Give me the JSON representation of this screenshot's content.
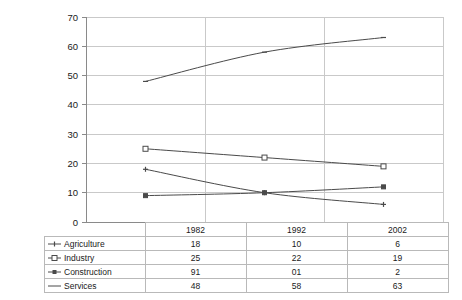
{
  "chart_data": {
    "type": "line",
    "title": "",
    "subtitle": "",
    "xlabel": "",
    "ylabel": "",
    "categories": [
      "1982",
      "1992",
      "2002"
    ],
    "ylim": [
      0,
      70
    ],
    "yticks": [
      0,
      10,
      20,
      30,
      40,
      50,
      60,
      70
    ],
    "grid": true,
    "legend_position": "table-below",
    "series": [
      {
        "name": "Agriculture",
        "values": [
          18,
          10,
          6
        ],
        "marker": "cross",
        "labels": [
          "18",
          "10",
          "6"
        ]
      },
      {
        "name": "Industry",
        "values": [
          25,
          22,
          19
        ],
        "marker": "square-open",
        "labels": [
          "25",
          "22",
          "19"
        ]
      },
      {
        "name": "Construction",
        "values": [
          9,
          10,
          12
        ],
        "marker": "square-filled",
        "labels": [
          "91",
          "01",
          "2"
        ]
      },
      {
        "name": "Services",
        "values": [
          48,
          58,
          63
        ],
        "marker": "dash",
        "labels": [
          "48",
          "58",
          "63"
        ]
      }
    ]
  },
  "axis": {
    "y_tick_labels": [
      "70",
      "60",
      "50",
      "40",
      "30",
      "20",
      "10",
      "0"
    ]
  },
  "table": {
    "corner_label": "",
    "column_headers": [
      "1982",
      "1992",
      "2002"
    ],
    "rows": [
      {
        "label": "Agriculture",
        "values": [
          "18",
          "10",
          "6"
        ]
      },
      {
        "label": "Industry",
        "values": [
          "25",
          "22",
          "19"
        ]
      },
      {
        "label": "Construction",
        "values": [
          "91",
          "01",
          "2"
        ]
      },
      {
        "label": "Services",
        "values": [
          "48",
          "58",
          "63"
        ]
      }
    ]
  },
  "colors": {
    "line": "#4a4a4a",
    "grid": "#c9c9c9",
    "axis": "#8a8a8a",
    "table_border": "#b9b9b9",
    "text": "#1a1a1a",
    "background": "#ffffff"
  }
}
